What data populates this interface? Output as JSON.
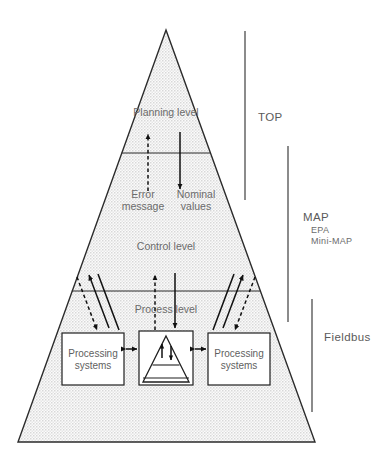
{
  "figure": {
    "background_color": "#ffffff",
    "pyramid_fill_color": "#ededed",
    "outline_color": "#2b2b2b"
  },
  "pyramid": {
    "levels": [
      {
        "id": "planning",
        "label": "Planning level"
      },
      {
        "id": "control",
        "label": "Control level"
      },
      {
        "id": "process",
        "label": "Process level"
      }
    ]
  },
  "flows": [
    {
      "id": "error-message",
      "label": "Error message",
      "label_line1": "Error",
      "label_line2": "message",
      "direction": "up",
      "style": "dashed"
    },
    {
      "id": "nominal-values",
      "label": "Nominal values",
      "label_line1": "Nominal",
      "label_line2": "values",
      "direction": "down",
      "style": "solid"
    }
  ],
  "units": [
    {
      "id": "processing-systems-left",
      "line1": "Processing",
      "line2": "systems"
    },
    {
      "id": "central-control-unit",
      "line1": "",
      "line2": ""
    },
    {
      "id": "processing-systems-right",
      "line1": "Processing",
      "line2": "systems"
    }
  ],
  "sidebar": {
    "scopes": [
      {
        "id": "top",
        "label": "TOP",
        "sub_labels": []
      },
      {
        "id": "map",
        "label": "MAP",
        "sub_labels": [
          "EPA",
          "Mini-MAP"
        ]
      },
      {
        "id": "fieldbus",
        "label": "Fieldbus",
        "sub_labels": []
      }
    ]
  }
}
